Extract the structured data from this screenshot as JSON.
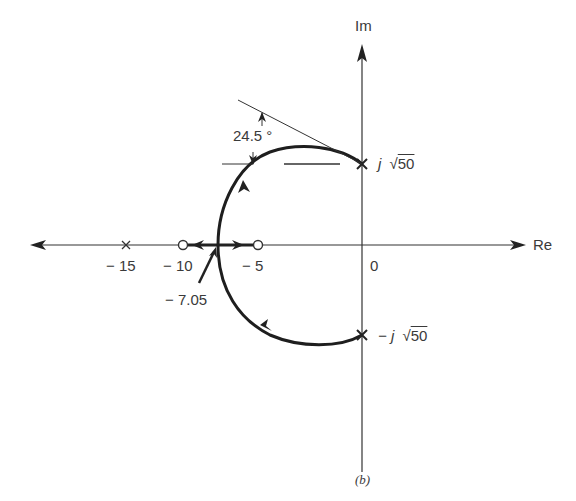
{
  "figure": {
    "caption": "(b)",
    "axes": {
      "real_label": "Re",
      "imag_label": "Im",
      "origin_label": "0"
    },
    "tick_labels": {
      "minus15": "− 15",
      "minus10": "− 10",
      "minus5": "− 5"
    },
    "annotations": {
      "breakaway": "− 7.05",
      "angle": "24.5 °",
      "pole_upper": "j √50",
      "pole_upper_j": "j",
      "pole_upper_val": "50",
      "pole_lower_prefix": "− j",
      "pole_lower_val": "50"
    },
    "poles": [
      {
        "re": -15,
        "im": 0,
        "symbol": "x"
      },
      {
        "re": 0,
        "im": 7.07,
        "label": "j√50",
        "symbol": "x"
      },
      {
        "re": 0,
        "im": -7.07,
        "label": "-j√50",
        "symbol": "x"
      }
    ],
    "zeros": [
      {
        "re": -10,
        "im": 0,
        "symbol": "o"
      },
      {
        "re": -5,
        "im": 0,
        "symbol": "o"
      }
    ],
    "breakaway_point": -7.05,
    "departure_angle_deg": 24.5
  }
}
